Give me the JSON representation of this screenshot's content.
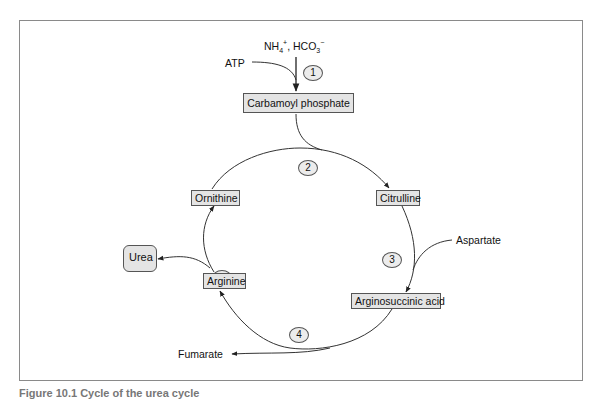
{
  "figure": {
    "title": "Urea cycle",
    "caption": "Figure 10.1  Cycle of the urea cycle"
  },
  "inputs": {
    "top_reactants": "NH4+, HCO3−",
    "top_reactants_parts": {
      "nh": "NH",
      "nh_sub": "4",
      "nh_sup": "+",
      "sep": ", HCO",
      "hco_sub": "3",
      "hco_sup": "−"
    },
    "atp": "ATP",
    "aspartate": "Aspartate"
  },
  "outputs": {
    "urea": "Urea",
    "fumarate": "Fumarate"
  },
  "nodes": {
    "carbamoyl_phosphate": "Carbamoyl phosphate",
    "citrulline": "Citrulline",
    "arginosuccinic_acid": "Arginosuccinic acid",
    "arginine": "Arginine",
    "ornithine": "Ornithine"
  },
  "steps": [
    "1",
    "2",
    "3",
    "4",
    "5"
  ],
  "colors": {
    "box_fill": "#e4e4e4",
    "line": "#333333",
    "frame": "#8a8a8a"
  }
}
